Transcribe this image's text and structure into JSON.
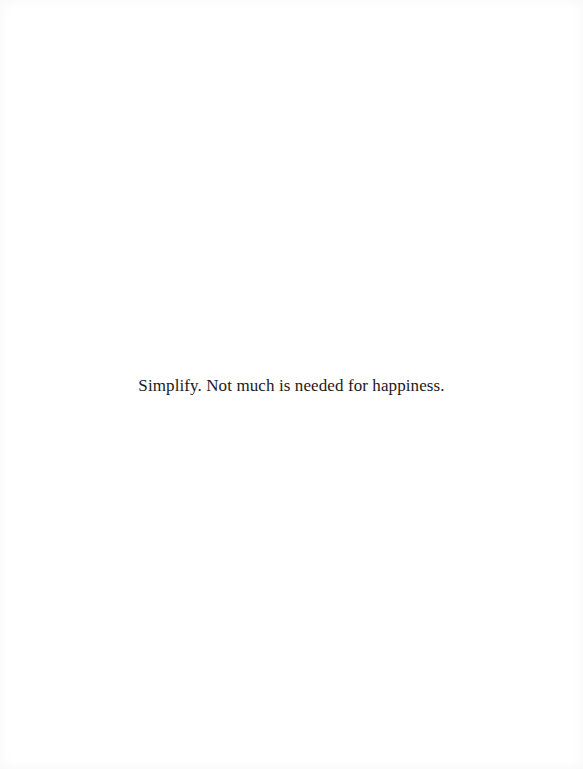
{
  "page": {
    "quote": "Simplify. Not much is needed for happiness."
  },
  "colors": {
    "background": "#ffffff",
    "text": "#1a1a1a"
  }
}
